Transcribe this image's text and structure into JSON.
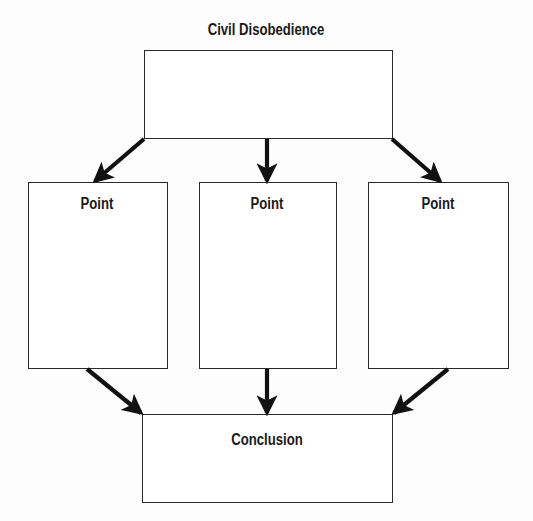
{
  "diagram": {
    "title": "Civil Disobedience",
    "points": [
      {
        "label": "Point"
      },
      {
        "label": "Point"
      },
      {
        "label": "Point"
      }
    ],
    "conclusion": {
      "label": "Conclusion"
    },
    "colors": {
      "stroke": "#2a2a2a",
      "arrow": "#111111",
      "text": "#1a1a1a",
      "background": "#fdfdfd"
    }
  }
}
